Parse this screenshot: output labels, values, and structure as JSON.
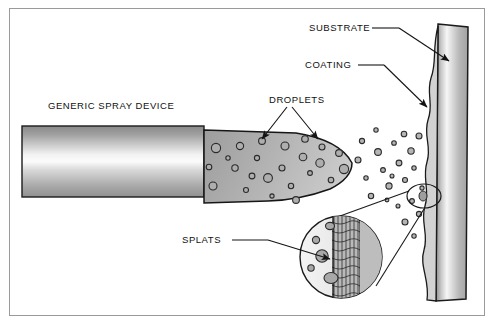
{
  "figure": {
    "background_color": "#ffffff",
    "border_color": "#9a9a9a",
    "line_color": "#1a1a1a",
    "labels": {
      "spray_device": "GENERIC SPRAY DEVICE",
      "substrate": "SUBSTRATE",
      "coating": "COATING",
      "droplets": "DROPLETS",
      "splats": "SPLATS"
    },
    "parts": {
      "gun_body": {
        "name": "generic-spray-device-body",
        "fill": "linear gradient gray"
      },
      "plume": {
        "name": "spray-plume",
        "fill": "gray gradient bullet shape"
      },
      "substrate_bar": {
        "name": "substrate-bar",
        "fill": "vertical gray gradient"
      },
      "coating_layer": {
        "name": "coating-layer",
        "fill": "#d8d8d8 wavy band"
      },
      "magnifier": {
        "name": "splat-magnifier-circle",
        "fill": "#ededed"
      },
      "callout_marker": {
        "name": "magnifier-source-marker"
      }
    },
    "droplet_color": "#b3b3b3",
    "droplet_stroke": "#2b2b2b"
  }
}
